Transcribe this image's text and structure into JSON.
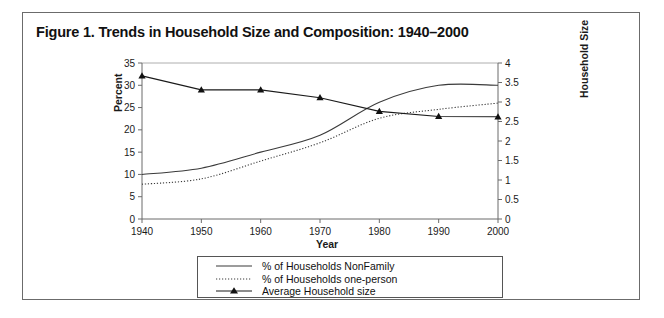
{
  "figure": {
    "title": "Figure 1. Trends in Household Size and Composition: 1940–2000",
    "frame_color": "#6b6b6b",
    "line_color": "#3a3a3a",
    "text_color": "#111111"
  },
  "chart_data": {
    "type": "line",
    "title": "Figure 1. Trends in Household Size and Composition: 1940–2000",
    "xlabel": "Year",
    "ylabel": "Percent",
    "y2label": "Household Size",
    "x": [
      1940,
      1950,
      1960,
      1970,
      1980,
      1990,
      2000
    ],
    "xlim": [
      1940,
      2000
    ],
    "ylim": [
      0,
      35
    ],
    "y2lim": [
      0,
      4
    ],
    "xticks": [
      "1940",
      "1950",
      "1960",
      "1970",
      "1980",
      "1990",
      "2000"
    ],
    "yticks": [
      "0",
      "5",
      "10",
      "15",
      "20",
      "25",
      "30",
      "35"
    ],
    "y2ticks": [
      "0",
      "0.5",
      "1",
      "1.5",
      "2",
      "2.5",
      "3",
      "3.5",
      "4"
    ],
    "grid": false,
    "legend_position": "bottom",
    "series": [
      {
        "name": "% of Households NonFamily",
        "axis": "left",
        "style": "solid",
        "marker": "none",
        "values": [
          10.0,
          11.4,
          15.0,
          18.8,
          26.2,
          30.0,
          30.0
        ]
      },
      {
        "name": "% of Households one-person",
        "axis": "left",
        "style": "dotted",
        "marker": "none",
        "values": [
          7.8,
          9.0,
          13.0,
          17.1,
          22.6,
          24.6,
          26.0
        ]
      },
      {
        "name": "Average Household size",
        "axis": "right",
        "style": "solid",
        "marker": "triangle",
        "values": [
          3.67,
          3.31,
          3.31,
          3.11,
          2.76,
          2.63,
          2.62
        ]
      }
    ]
  },
  "legend": {
    "items": [
      {
        "label": "% of Households NonFamily",
        "key": "solid-line-key"
      },
      {
        "label": "% of Households one-person",
        "key": "dotted-line-key"
      },
      {
        "label": "Average Household size",
        "key": "triangle-marker-key"
      }
    ]
  },
  "axes": {
    "x_title": "Year",
    "y_left_title": "Percent",
    "y_right_title": "Household Size"
  }
}
